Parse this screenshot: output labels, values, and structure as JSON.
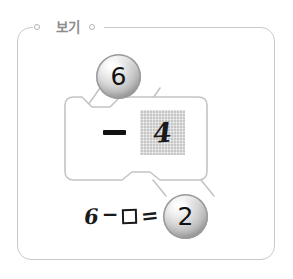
{
  "figure": {
    "legend_label": "보기",
    "legend_dot_left_icon": "small-circle-icon",
    "legend_dot_right_icon": "small-circle-icon"
  },
  "badges": {
    "top": {
      "value": "6",
      "role": "minuend"
    },
    "bottom": {
      "value": "2",
      "role": "difference"
    }
  },
  "operation_box": {
    "operator": "−",
    "answer_tile": {
      "value": "4",
      "role": "subtrahend"
    }
  },
  "equation": {
    "first_number": "6",
    "operator": "−",
    "blank_box_icon": "empty-square-icon",
    "equals": "=",
    "result": "2",
    "full_text": "6−□=2"
  },
  "colors": {
    "frame_stroke": "#c9c9c9",
    "legend_text": "#8d8d8d",
    "tile_background": "#c6c6c6",
    "ink": "#1a1a1a",
    "marble_edge": "#9b9b9b"
  }
}
